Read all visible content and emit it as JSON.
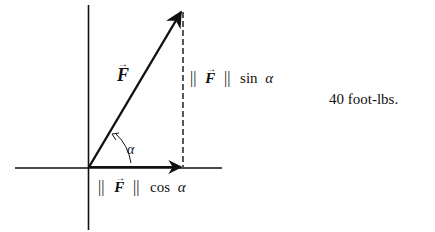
{
  "diagram": {
    "vector_label": "F",
    "vector_arrow": "→",
    "norm_bar": "||",
    "angle_label": "α",
    "sin_label": "sin",
    "cos_label": "cos",
    "side_note": "40 foot-lbs.",
    "colors": {
      "ink": "#111111",
      "background": "#ffffff"
    }
  }
}
